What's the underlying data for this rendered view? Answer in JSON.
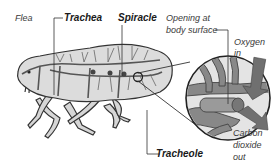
{
  "diagram": {
    "labels": {
      "flea": "Flea",
      "trachea": "Trachea",
      "spiracle": "Spiracle",
      "opening_line1": "Opening at",
      "opening_line2": "body surface",
      "oxygen_line1": "Oxygen",
      "oxygen_line2": "in",
      "carbon_line1": "Carbon",
      "carbon_line2": "dioxide",
      "carbon_line3": "out",
      "tracheole": "Tracheole"
    },
    "colors": {
      "body_fill": "#dcdcdc",
      "trachea": "#555555",
      "outline": "#333333",
      "arrow": "#6e6e6e",
      "circle_fill": "#e6e6e6"
    }
  }
}
